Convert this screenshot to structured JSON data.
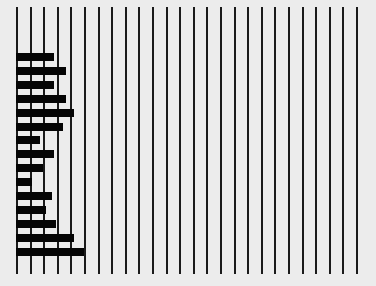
{
  "chart_data": {
    "type": "bar",
    "orientation": "horizontal",
    "title": "",
    "xlabel": "",
    "ylabel": "",
    "grid": {
      "vertical_lines": 26,
      "horizontal": false
    },
    "xlim": [
      0,
      25
    ],
    "categories": [
      "1",
      "2",
      "3",
      "4",
      "5",
      "6",
      "7",
      "8",
      "9",
      "10",
      "11",
      "12",
      "13",
      "14",
      "15"
    ],
    "values": [
      2.7,
      3.6,
      2.7,
      3.6,
      4.2,
      3.4,
      1.7,
      2.7,
      1.9,
      1.1,
      2.6,
      2.1,
      2.9,
      4.2,
      4.9
    ],
    "colors": {
      "bar": "#050505",
      "grid": "#1a1a1a",
      "background": "#ececec"
    },
    "layout": {
      "plot_left_px": 17,
      "line_spacing_px": 13.6,
      "first_bar_top_px": 53,
      "bar_pitch_px": 13.9,
      "bar_height_px": 8
    }
  }
}
